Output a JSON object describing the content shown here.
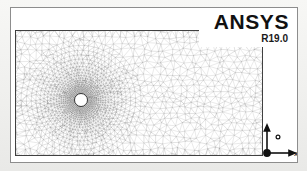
{
  "window": {
    "title": "ANSYS Mesh Plot Window",
    "background_color": "#ffffff",
    "border_color": "#8d8d8d"
  },
  "logo": {
    "brand": "ANSYS",
    "version": "R19.0",
    "text_color": "#111111"
  },
  "axis_triad": {
    "x_label": "X",
    "y_label": "Y",
    "origin_marker": "origin-dot",
    "color": "#111111"
  },
  "mesh": {
    "description": "Unstructured triangular mesh of 2D flow domain around circular cylinder",
    "line_color": "#6b6b6b",
    "fill_color": "#ffffff",
    "hole_fill": "#ffffff",
    "boundary_color": "#2b2b2b",
    "domain": {
      "x_min": 0,
      "x_max": 248,
      "y_min": 0,
      "y_max": 126
    },
    "cylinder": {
      "center_x": 66,
      "center_y": 70,
      "radius": 6.5,
      "label": "cylinder-hole"
    },
    "refinement": {
      "near_wall_density": "high",
      "far_field_density": "low",
      "wake_refinement": true
    }
  },
  "chart_data": {
    "type": "mesh",
    "xlabel": "X",
    "ylabel": "Y",
    "domain_extent": [
      248,
      126
    ],
    "cylinder_center": [
      66,
      70
    ],
    "cylinder_radius": 6.5,
    "node_seed_rings": [
      8,
      14,
      22,
      32,
      46,
      64,
      86
    ],
    "far_field_spacing": 7.0,
    "near_wall_spacing": 1.4
  }
}
